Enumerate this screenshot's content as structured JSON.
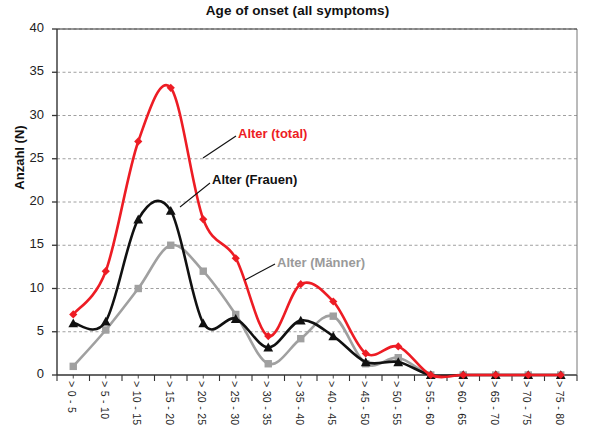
{
  "chart_data": {
    "type": "line",
    "title": "Age of onset (all symptoms)",
    "xlabel": "",
    "ylabel": "Anzahl (N)",
    "ylim": [
      0,
      40
    ],
    "yticks": [
      0,
      5,
      10,
      15,
      20,
      25,
      30,
      35,
      40
    ],
    "grid": true,
    "legend_position": "inline-annotations",
    "categories": [
      "> 0 - 5",
      "> 5 - 10",
      "> 10 - 15",
      "> 15 - 20",
      "> 20 - 25",
      "> 25 - 30",
      "> 30 - 35",
      "> 35 - 40",
      "> 40 - 45",
      "> 45 - 50",
      "> 50 - 55",
      "> 55 - 60",
      "> 60 - 65",
      "> 65 - 70",
      "> 70 - 75",
      "> 75 - 80"
    ],
    "series": [
      {
        "name": "Alter (total)",
        "color": "#ED1C24",
        "marker": "diamond",
        "values": [
          7,
          12,
          27,
          33.2,
          18,
          13.5,
          4.5,
          10.5,
          8.5,
          2.5,
          3.3,
          0,
          0,
          0,
          0,
          0
        ]
      },
      {
        "name": "Alter (Frauen)",
        "color": "#111111",
        "marker": "triangle",
        "values": [
          6,
          6.2,
          18,
          19,
          6,
          6.5,
          3.2,
          6.3,
          4.5,
          1.5,
          1.5,
          0,
          0,
          0,
          0,
          0
        ]
      },
      {
        "name": "Alter (Männer)",
        "color": "#A0A0A0",
        "marker": "square",
        "values": [
          1,
          5.2,
          10,
          15,
          12,
          7,
          1.3,
          4.2,
          6.8,
          1.3,
          2,
          0,
          0,
          0,
          0,
          0
        ]
      }
    ],
    "annotations": [
      {
        "text": "Alter (total)",
        "color": "#ED1C24"
      },
      {
        "text": "Alter (Frauen)",
        "color": "#111111"
      },
      {
        "text": "Alter (Männer)",
        "color": "#9A9A9A"
      }
    ]
  }
}
